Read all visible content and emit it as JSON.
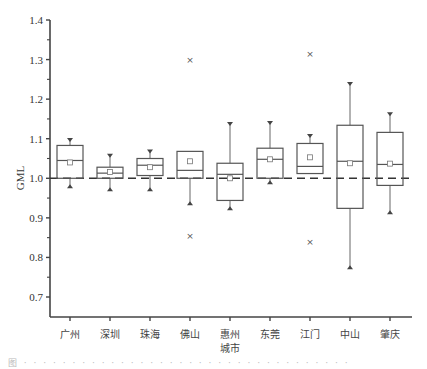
{
  "chart_data": {
    "type": "box",
    "title": "",
    "xlabel": "",
    "ylabel": "GML",
    "ylim": [
      0.65,
      1.4
    ],
    "yticks": [
      0.7,
      0.8,
      0.9,
      1.0,
      1.1,
      1.2,
      1.3,
      1.4
    ],
    "ytick_labels": [
      "0.7",
      "0.8",
      "0.9",
      "1.0",
      "1.1",
      "1.2",
      "1.3",
      "1.4"
    ],
    "reference_line": {
      "y": 1.0,
      "style": "dashed"
    },
    "grid": false,
    "legend": null,
    "categories": [
      "广州",
      "深圳",
      "珠海",
      "佛山",
      "惠州城市",
      "东莞",
      "江门",
      "中山",
      "肇庆"
    ],
    "category_labels": [
      [
        "广州"
      ],
      [
        "深圳"
      ],
      [
        "珠海"
      ],
      [
        "佛山"
      ],
      [
        "惠州",
        "城市"
      ],
      [
        "东莞"
      ],
      [
        "江门"
      ],
      [
        "中山"
      ],
      [
        "肇庆"
      ]
    ],
    "boxes": [
      {
        "name": "广州",
        "whisker_low": 0.98,
        "q1": 1.0,
        "median": 1.045,
        "q3": 1.083,
        "whisker_high": 1.097,
        "mean": 1.04,
        "outliers": []
      },
      {
        "name": "深圳",
        "whisker_low": 0.972,
        "q1": 1.0,
        "median": 1.013,
        "q3": 1.028,
        "whisker_high": 1.057,
        "mean": 1.016,
        "outliers": []
      },
      {
        "name": "珠海",
        "whisker_low": 0.972,
        "q1": 1.007,
        "median": 1.033,
        "q3": 1.05,
        "whisker_high": 1.068,
        "mean": 1.028,
        "outliers": []
      },
      {
        "name": "佛山",
        "whisker_low": 0.937,
        "q1": 1.0,
        "median": 1.02,
        "q3": 1.068,
        "whisker_high": 1.0,
        "mean": 1.043,
        "outliers": [
          1.3,
          0.853
        ]
      },
      {
        "name": "惠州城市",
        "whisker_low": 0.924,
        "q1": 0.944,
        "median": 1.01,
        "q3": 1.038,
        "whisker_high": 1.137,
        "mean": 1.0,
        "outliers": []
      },
      {
        "name": "东莞",
        "whisker_low": 0.99,
        "q1": 1.0,
        "median": 1.048,
        "q3": 1.076,
        "whisker_high": 1.14,
        "mean": 1.048,
        "outliers": []
      },
      {
        "name": "江门",
        "whisker_low": 1.012,
        "q1": 1.012,
        "median": 1.03,
        "q3": 1.088,
        "whisker_high": 1.107,
        "mean": 1.053,
        "outliers": [
          1.313,
          0.84
        ]
      },
      {
        "name": "中山",
        "whisker_low": 0.775,
        "q1": 0.924,
        "median": 1.043,
        "q3": 1.134,
        "whisker_high": 1.238,
        "mean": 1.038,
        "outliers": []
      },
      {
        "name": "肇庆",
        "whisker_low": 0.914,
        "q1": 0.982,
        "median": 1.035,
        "q3": 1.116,
        "whisker_high": 1.162,
        "mean": 1.037,
        "outliers": []
      }
    ]
  },
  "caption": "图 · · · · · · · · · · · · · · · · · · · · · · · · · · · · · · · · · ·"
}
